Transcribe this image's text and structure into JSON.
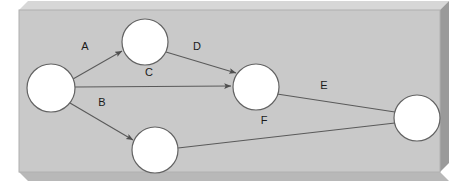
{
  "figure": {
    "canvas": {
      "width": 469,
      "height": 188,
      "background": "#ffffff"
    }
  },
  "panel": {
    "name": "3d-slab-panel",
    "face_color": "#c9c9c9",
    "face_stroke": "#b0b0b0",
    "top_bevel_color": "#d7d7d7",
    "right_side_color": "#9a9a9a",
    "bottom_side_color": "#b8b8b8",
    "face": {
      "x": 19,
      "y": 10,
      "width": 421,
      "height": 162
    },
    "depth_x": 9,
    "depth_y": 9
  },
  "graph": {
    "node_fill": "#ffffff",
    "node_stroke": "#636363",
    "node_stroke_width": 1.2,
    "node_radius": 23,
    "edge_color": "#5a5a5a",
    "edge_width": 1.1,
    "label_color": "#1a1a1a",
    "nodes": [
      {
        "id": "n1",
        "label": "",
        "cx": 51,
        "cy": 88,
        "r": 24,
        "name": "node-left"
      },
      {
        "id": "n2",
        "label": "",
        "cx": 145,
        "cy": 42,
        "r": 23,
        "name": "node-top"
      },
      {
        "id": "n3",
        "label": "",
        "cx": 256,
        "cy": 87,
        "r": 23,
        "name": "node-middle"
      },
      {
        "id": "n4",
        "label": "",
        "cx": 155,
        "cy": 150,
        "r": 23,
        "name": "node-bottom"
      },
      {
        "id": "n5",
        "label": "",
        "cx": 417,
        "cy": 118,
        "r": 23,
        "name": "node-right"
      }
    ],
    "edges": [
      {
        "id": "eA",
        "label": "A",
        "from": "n1",
        "to": "n2",
        "arrow": true,
        "x1": 73,
        "y1": 79,
        "x2": 122,
        "y2": 51,
        "label_x": 85,
        "label_y": 47
      },
      {
        "id": "eB",
        "label": "B",
        "from": "n1",
        "to": "n4",
        "arrow": true,
        "x1": 70,
        "y1": 103,
        "x2": 133,
        "y2": 140,
        "label_x": 102,
        "label_y": 103
      },
      {
        "id": "eC",
        "label": "C",
        "from": "n1",
        "to": "n3",
        "arrow": true,
        "x1": 75,
        "y1": 87,
        "x2": 231,
        "y2": 86,
        "label_x": 149,
        "label_y": 73
      },
      {
        "id": "eD",
        "label": "D",
        "from": "n2",
        "to": "n3",
        "arrow": true,
        "x1": 166,
        "y1": 52,
        "x2": 236,
        "y2": 73,
        "label_x": 197,
        "label_y": 47
      },
      {
        "id": "eE",
        "label": "E",
        "from": "n3",
        "to": "n5",
        "arrow": false,
        "x1": 277,
        "y1": 94,
        "x2": 395,
        "y2": 112,
        "label_x": 324,
        "label_y": 86
      },
      {
        "id": "eF",
        "label": "F",
        "from": "n4",
        "to": "n5",
        "arrow": false,
        "x1": 178,
        "y1": 148,
        "x2": 395,
        "y2": 123,
        "label_x": 264,
        "label_y": 121
      }
    ]
  }
}
